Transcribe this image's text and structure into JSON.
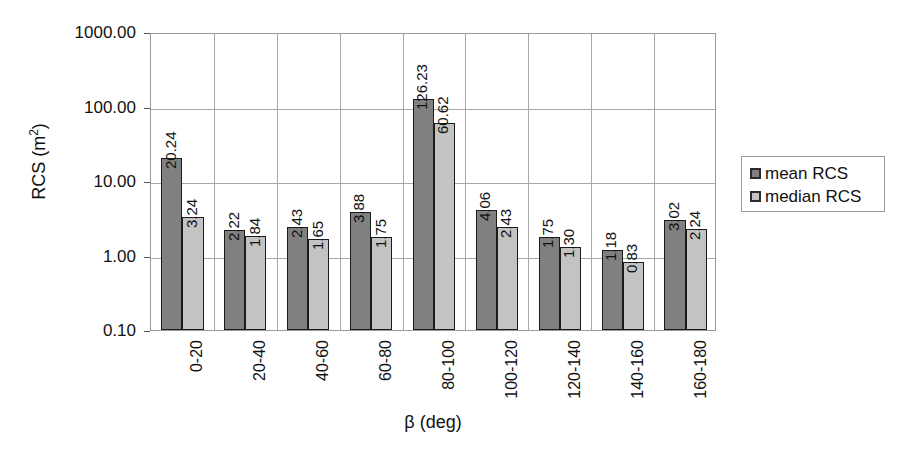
{
  "chart_data": {
    "type": "bar",
    "title": "",
    "xlabel": "β (deg)",
    "ylabel": "RCS (m²)",
    "ylabel_text": "RCS (m",
    "ylabel_sup": "2",
    "ylabel_tail": ")",
    "yscale": "log",
    "ylim": [
      0.1,
      1000
    ],
    "ytick_labels": [
      "1000.00",
      "100.00",
      "10.00",
      "1.00",
      "0.10"
    ],
    "ytick_values": [
      1000,
      100,
      10,
      1,
      0.1
    ],
    "grid": true,
    "legend_position": "right",
    "categories": [
      "0-20",
      "20-40",
      "40-60",
      "60-80",
      "80-100",
      "100-120",
      "120-140",
      "140-160",
      "160-180"
    ],
    "series": [
      {
        "name": "mean RCS",
        "color": "#808080",
        "values": [
          20.24,
          2.22,
          2.43,
          3.88,
          126.23,
          4.06,
          1.75,
          1.18,
          3.02
        ],
        "labels": [
          "20.24",
          "2.22",
          "2.43",
          "3.88",
          "126.23",
          "4.06",
          "1.75",
          "1.18",
          "3.02"
        ]
      },
      {
        "name": "median RCS",
        "color": "#c3c3c3",
        "values": [
          3.24,
          1.84,
          1.65,
          1.75,
          60.62,
          2.43,
          1.3,
          0.83,
          2.24
        ],
        "labels": [
          "3.24",
          "1.84",
          "1.65",
          "1.75",
          "60.62",
          "2.43",
          "1.30",
          "0.83",
          "2.24"
        ]
      }
    ]
  },
  "legend": {
    "entries": [
      {
        "label": "mean RCS",
        "color": "#808080"
      },
      {
        "label": "median RCS",
        "color": "#c3c3c3"
      }
    ]
  }
}
